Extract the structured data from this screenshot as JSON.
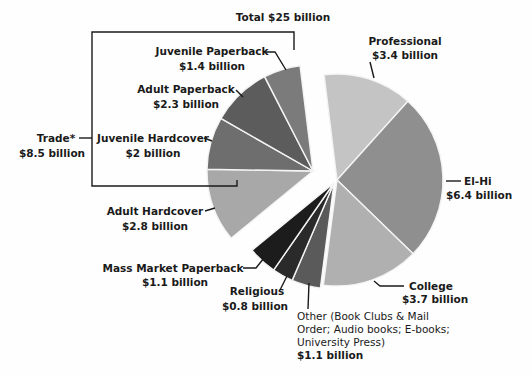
{
  "chart_data": {
    "type": "pie",
    "title": "Total $25 billion",
    "unit": "billion USD",
    "start_angle_deg": -7,
    "slices": [
      {
        "name": "Professional",
        "value": 3.4,
        "label": "Professional",
        "value_label": "$3.4 billion",
        "color": "#c4c4c4",
        "group": "main"
      },
      {
        "name": "El-Hi",
        "value": 6.4,
        "label": "El-Hi",
        "value_label": "$6.4 billion",
        "color": "#8f8f8f",
        "group": "main"
      },
      {
        "name": "College",
        "value": 3.7,
        "label": "College",
        "value_label": "$3.7 billion",
        "color": "#b0b0b0",
        "group": "main"
      },
      {
        "name": "Other",
        "value": 1.1,
        "label_lines": [
          "Other (Book Clubs & Mail",
          "Order; Audio books; E-books;",
          "University Press)"
        ],
        "value_label": "$1.1 billion",
        "color": "#5a5a5a",
        "group": "main"
      },
      {
        "name": "Religious",
        "value": 0.8,
        "label": "Religious",
        "value_label": "$0.8 billion",
        "color": "#2a2a2a",
        "group": "main"
      },
      {
        "name": "Mass Market Paperback",
        "value": 1.1,
        "label": "Mass Market Paperback",
        "value_label": "$1.1 billion",
        "color": "#1c1c1c",
        "group": "main"
      },
      {
        "name": "Adult Hardcover",
        "value": 2.8,
        "label": "Adult Hardcover",
        "value_label": "$2.8 billion",
        "color": "#a8a8a8",
        "group": "trade"
      },
      {
        "name": "Juvenile Hardcover",
        "value": 2.0,
        "label": "Juvenile Hardcover",
        "value_label": "$2 billion",
        "color": "#6e6e6e",
        "group": "trade"
      },
      {
        "name": "Adult Paperback",
        "value": 2.3,
        "label": "Adult Paperback",
        "value_label": "$2.3 billion",
        "color": "#5c5c5c",
        "group": "trade"
      },
      {
        "name": "Juvenile Paperback",
        "value": 1.4,
        "label": "Juvenile Paperback",
        "value_label": "$1.4 billion",
        "color": "#7b7b7b",
        "group": "trade"
      }
    ],
    "groups": [
      {
        "name": "Trade",
        "label": "Trade*",
        "value_label": "$8.5 billion",
        "value": 8.5,
        "exploded": true
      }
    ],
    "total": 25
  }
}
